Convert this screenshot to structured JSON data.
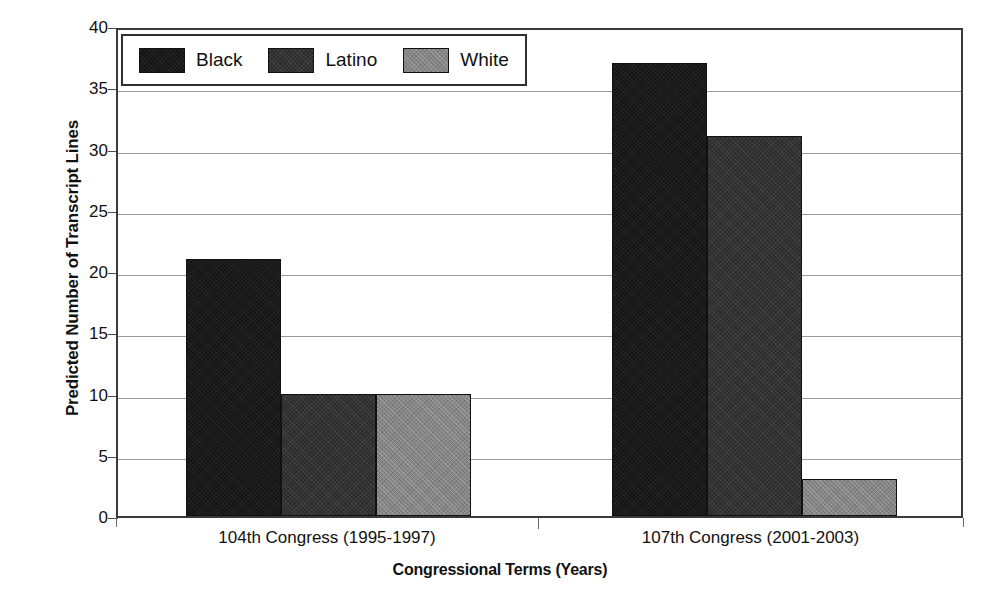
{
  "chart_data": {
    "type": "bar",
    "title": "",
    "xlabel": "Congressional Terms (Years)",
    "ylabel": "Predicted Number of Transcript Lines",
    "categories": [
      "104th Congress (1995-1997)",
      "107th Congress (2001-2003)"
    ],
    "series": [
      {
        "name": "Black",
        "values": [
          21,
          37
        ],
        "color": "#151515"
      },
      {
        "name": "Latino",
        "values": [
          10,
          31
        ],
        "color": "#2c2c2c"
      },
      {
        "name": "White",
        "values": [
          10,
          3
        ],
        "color": "#858585"
      }
    ],
    "ylim": [
      0,
      40
    ],
    "yticks": [
      0,
      5,
      10,
      15,
      20,
      25,
      30,
      35,
      40
    ],
    "ytick_labels": [
      "0",
      "5",
      "10",
      "15",
      "20",
      "25",
      "30",
      "35",
      "40"
    ],
    "grid": true,
    "legend_position": "top-left",
    "legend_entries": [
      "Black",
      "Latino",
      "White"
    ]
  },
  "axes": {
    "y_title": "Predicted Number of Transcript Lines",
    "x_title": "Congressional Terms (Years)"
  },
  "legend": {
    "items": [
      {
        "label": "Black"
      },
      {
        "label": "Latino"
      },
      {
        "label": "White"
      }
    ]
  },
  "x_categories": [
    {
      "label": "104th Congress (1995-1997)"
    },
    {
      "label": "107th Congress (2001-2003)"
    }
  ],
  "y_ticks": [
    {
      "label": "40"
    },
    {
      "label": "35"
    },
    {
      "label": "30"
    },
    {
      "label": "25"
    },
    {
      "label": "20"
    },
    {
      "label": "15"
    },
    {
      "label": "10"
    },
    {
      "label": "5"
    },
    {
      "label": "0"
    }
  ]
}
